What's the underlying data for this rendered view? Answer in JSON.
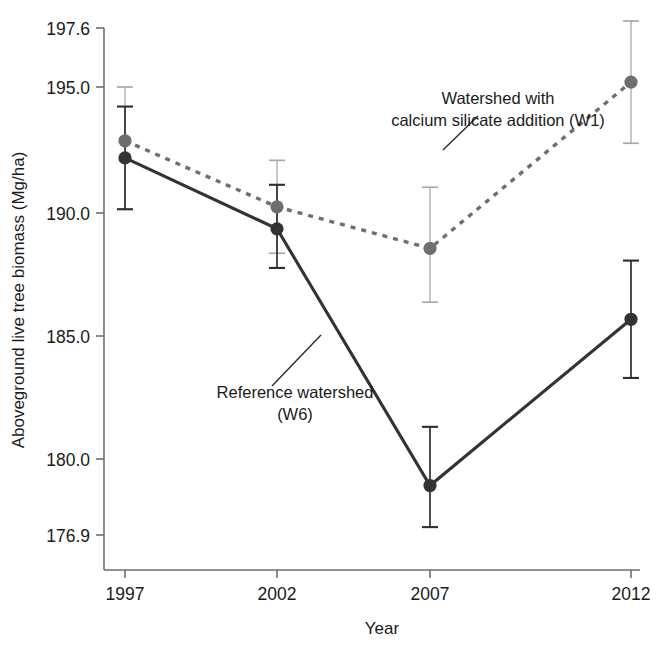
{
  "chart_data": {
    "type": "line",
    "title": "",
    "xlabel": "Year",
    "ylabel": "Aboveground live tree biomass (Mg/ha)",
    "x": [
      1997,
      2002,
      2007,
      2012
    ],
    "xtick_labels": [
      "1997",
      "2002",
      "2007",
      "2012"
    ],
    "ytick_values": [
      197.6,
      195.0,
      190.0,
      185.0,
      180.0,
      176.9
    ],
    "ytick_labels": [
      "197.6",
      "195.0",
      "190.0",
      "185.0",
      "180.0",
      "176.9"
    ],
    "ylim": [
      176.9,
      197.6
    ],
    "grid": false,
    "legend": "annotations",
    "series": [
      {
        "name": "Watershed with calcium silicate addition (W1)",
        "short_name": "W1",
        "linestyle": "dotted",
        "color": "#6e6e6e",
        "marker": "circle",
        "values": [
          192.8,
          190.1,
          188.4,
          195.2
        ],
        "err_low": [
          2.8,
          1.9,
          2.2,
          2.5
        ],
        "err_high": [
          2.2,
          1.9,
          2.5,
          2.5
        ]
      },
      {
        "name": "Reference watershed (W6)",
        "short_name": "W6",
        "linestyle": "solid",
        "color": "#333333",
        "marker": "circle",
        "values": [
          192.1,
          189.2,
          178.7,
          185.5
        ],
        "err_low": [
          2.1,
          1.6,
          1.7,
          2.4
        ],
        "err_high": [
          2.1,
          1.8,
          2.4,
          2.4
        ]
      }
    ],
    "annotations": [
      {
        "id": "w1-annotation",
        "lines": [
          "Watershed with",
          "calcium silicate addition (W1)"
        ],
        "leader_from": [
          443,
          150
        ],
        "leader_to": [
          478,
          118
        ]
      },
      {
        "id": "w6-annotation",
        "lines": [
          "Reference watershed",
          "(W6)"
        ],
        "leader_from": [
          272,
          386
        ],
        "leader_to": [
          320,
          336
        ]
      }
    ]
  },
  "axes": {
    "y_axis_title": "Aboveground live tree biomass (Mg/ha)",
    "x_axis_title": "Year"
  }
}
